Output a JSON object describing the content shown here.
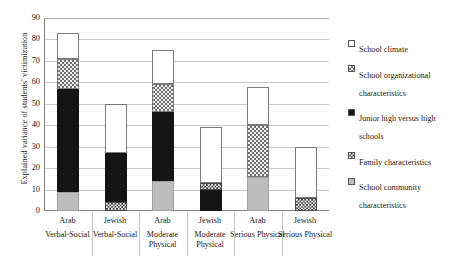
{
  "axes": {
    "ylabel": "Explained variance of students' victimization",
    "yticks": [
      "90",
      "80",
      "70",
      "60",
      "50",
      "40",
      "30",
      "20",
      "10",
      "0"
    ],
    "ylim": [
      0,
      90
    ]
  },
  "legend": {
    "items": [
      {
        "label": "School climate",
        "pattern": "white-outline",
        "key": "climate"
      },
      {
        "label": "School organizational characteristics",
        "pattern": "gray-checker",
        "key": "organizational"
      },
      {
        "label": "Junior high versus high schools",
        "pattern": "solid-black",
        "key": "junior_high"
      },
      {
        "label": "Family characteristics",
        "pattern": "fine-checker",
        "key": "family"
      },
      {
        "label": "School community characteristics",
        "pattern": "light-gray",
        "key": "community"
      }
    ]
  },
  "xlabels": [
    {
      "line1": "Arab",
      "line2": "Verbal-Social"
    },
    {
      "line1": "Jewish",
      "line2": "Verbal-Social"
    },
    {
      "line1": "Arab",
      "line2": "Moderate Physical"
    },
    {
      "line1": "Jewish",
      "line2": "Moderate Physical"
    },
    {
      "line1": "Arab",
      "line2": "Serious Physical"
    },
    {
      "line1": "Jewish",
      "line2": "Serious Physical"
    }
  ],
  "chart_data": {
    "type": "bar",
    "title": "",
    "xlabel": "",
    "ylabel": "Explained variance of students' victimization",
    "ylim": [
      0,
      90
    ],
    "grid": true,
    "stacked": true,
    "legend_position": "right",
    "categories": [
      "Arab Verbal-Social",
      "Jewish Verbal-Social",
      "Arab Moderate Physical",
      "Jewish Moderate Physical",
      "Arab Serious Physical",
      "Jewish Serious Physical"
    ],
    "series": [
      {
        "name": "School community characteristics",
        "values": [
          9,
          0,
          14,
          0,
          16,
          0
        ]
      },
      {
        "name": "Family characteristics",
        "values": [
          0,
          4,
          0,
          3,
          0,
          6
        ]
      },
      {
        "name": "Junior high versus high schools",
        "values": [
          48,
          23,
          32,
          10,
          0,
          0
        ]
      },
      {
        "name": "School organizational characteristics",
        "values": [
          14,
          0,
          13,
          0,
          24,
          0
        ]
      },
      {
        "name": "School climate",
        "values": [
          12,
          23,
          16,
          26,
          18,
          24
        ]
      }
    ],
    "totals": [
      83,
      50,
      75,
      39,
      58,
      30
    ]
  },
  "bars": [
    {
      "name": "Arab Verbal-Social",
      "total": 83,
      "segments": [
        {
          "key": "community",
          "value": 9,
          "from": 0,
          "to": 9
        },
        {
          "key": "junior_high",
          "value": 48,
          "from": 9,
          "to": 57
        },
        {
          "key": "organizational",
          "value": 14,
          "from": 57,
          "to": 71
        },
        {
          "key": "climate",
          "value": 12,
          "from": 71,
          "to": 83
        }
      ]
    },
    {
      "name": "Jewish Verbal-Social",
      "total": 50,
      "segments": [
        {
          "key": "family",
          "value": 4,
          "from": 0,
          "to": 4
        },
        {
          "key": "junior_high",
          "value": 23,
          "from": 4,
          "to": 27
        },
        {
          "key": "climate",
          "value": 23,
          "from": 27,
          "to": 50
        }
      ]
    },
    {
      "name": "Arab Moderate Physical",
      "total": 75,
      "segments": [
        {
          "key": "community",
          "value": 14,
          "from": 0,
          "to": 14
        },
        {
          "key": "junior_high",
          "value": 32,
          "from": 14,
          "to": 46
        },
        {
          "key": "organizational",
          "value": 13,
          "from": 46,
          "to": 59
        },
        {
          "key": "climate",
          "value": 16,
          "from": 59,
          "to": 75
        }
      ]
    },
    {
      "name": "Jewish Moderate Physical",
      "total": 39,
      "segments": [
        {
          "key": "junior_high",
          "value": 10,
          "from": 0,
          "to": 10
        },
        {
          "key": "family",
          "value": 3,
          "from": 10,
          "to": 13
        },
        {
          "key": "climate",
          "value": 26,
          "from": 13,
          "to": 39
        }
      ]
    },
    {
      "name": "Arab Serious Physical",
      "total": 58,
      "segments": [
        {
          "key": "community",
          "value": 16,
          "from": 0,
          "to": 16
        },
        {
          "key": "organizational",
          "value": 24,
          "from": 16,
          "to": 40
        },
        {
          "key": "climate",
          "value": 18,
          "from": 40,
          "to": 58
        }
      ]
    },
    {
      "name": "Jewish Serious Physical",
      "total": 30,
      "segments": [
        {
          "key": "family",
          "value": 6,
          "from": 0,
          "to": 6
        },
        {
          "key": "climate",
          "value": 24,
          "from": 6,
          "to": 30
        }
      ]
    }
  ]
}
